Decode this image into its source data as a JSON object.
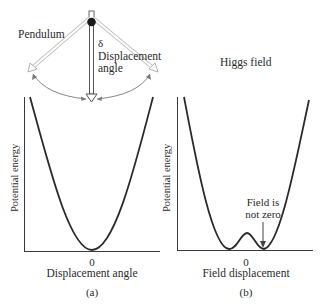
{
  "panel_a": {
    "pendulum_label": "Pendulum",
    "delta_symbol": "δ",
    "displacement_label_line1": "Displacement",
    "displacement_label_line2": "angle",
    "ylabel": "Potential energy",
    "xlabel": "Displacement angle",
    "zero_tick": "0",
    "caption": "(a)"
  },
  "panel_b": {
    "title": "Higgs field",
    "annotation_line1": "Field is",
    "annotation_line2": "not zero",
    "ylabel": "Potential energy",
    "xlabel": "Field displacement",
    "zero_tick": "0",
    "caption": "(b)"
  },
  "colors": {
    "curve": "#2a2a2a",
    "axis": "#3a3a3a",
    "pendulum_outline": "#b8b8b8",
    "bob": "#1a1a1a"
  }
}
